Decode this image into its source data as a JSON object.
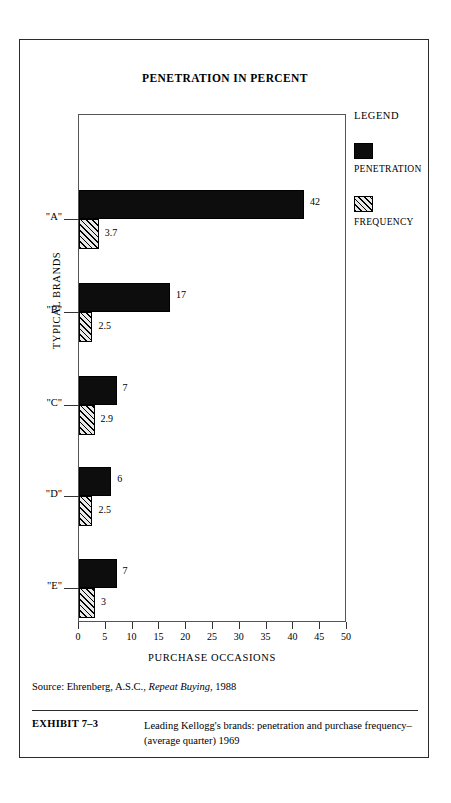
{
  "chart_data": {
    "type": "bar",
    "orientation": "horizontal",
    "title": "PENETRATION IN PERCENT",
    "xlabel": "PURCHASE OCCASIONS",
    "ylabel": "TYPICAL BRANDS",
    "xlim": [
      0,
      50
    ],
    "xticks": [
      0,
      5,
      10,
      15,
      20,
      25,
      30,
      35,
      40,
      45,
      50
    ],
    "grid": false,
    "legend_position": "right",
    "categories": [
      "\"A\"",
      "\"B\"",
      "\"C\"",
      "\"D\"",
      "\"E\""
    ],
    "series": [
      {
        "name": "PENETRATION",
        "color": "#0d0d0d",
        "fill": "solid",
        "values": [
          42,
          17,
          7,
          6,
          7
        ],
        "labels": [
          "42",
          "17",
          "7",
          "6",
          "7"
        ]
      },
      {
        "name": "FREQUENCY",
        "color": "#e8e8e8",
        "fill": "diagonal-hatch",
        "values": [
          3.7,
          2.5,
          2.9,
          2.5,
          3
        ],
        "labels": [
          "3.7",
          "2.5",
          "2.9",
          "2.5",
          "3"
        ]
      }
    ]
  },
  "legend": {
    "title": "LEGEND",
    "entries": [
      {
        "label": "PENETRATION",
        "swatch": "solid-black-swatch"
      },
      {
        "label": "FREQUENCY",
        "swatch": "hatched-swatch"
      }
    ]
  },
  "source": {
    "prefix": "Source: Ehrenberg, A.S.C., ",
    "italic_title": "Repeat Buying",
    "suffix": ", 1988"
  },
  "caption": {
    "label": "EXHIBIT 7–3",
    "text": "Leading Kellogg's brands: penetration and purchase frequency–(average quarter) 1969"
  }
}
